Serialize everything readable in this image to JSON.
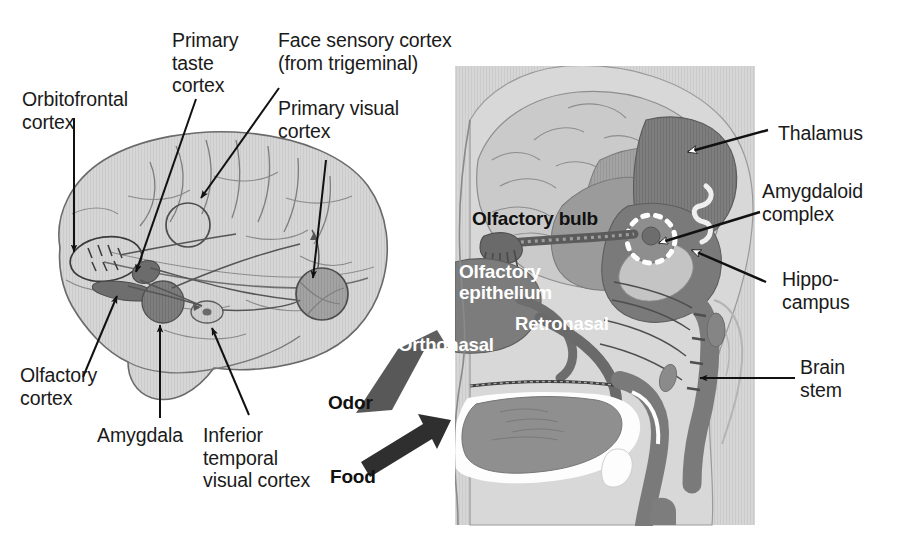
{
  "figure": {
    "type": "anatomical-diagram",
    "panels": [
      {
        "id": "left-lateral-brain",
        "description": "Lateral view of the human brain with labelled cortical areas and connecting pathways"
      },
      {
        "id": "right-midsagittal-head",
        "description": "Mid-sagittal section of the head showing nasal cavity, olfactory bulb and limbic structures"
      }
    ]
  },
  "left_panel": {
    "labels": [
      {
        "id": "orbitofrontal-cortex",
        "text": "Orbitofrontal\ncortex"
      },
      {
        "id": "primary-taste-cortex",
        "text": "Primary\ntaste\ncortex"
      },
      {
        "id": "face-sensory-cortex",
        "text": "Face sensory cortex\n(from trigeminal)"
      },
      {
        "id": "primary-visual-cortex",
        "text": "Primary visual\ncortex"
      },
      {
        "id": "olfactory-cortex",
        "text": "Olfactory\ncortex"
      },
      {
        "id": "amygdala",
        "text": "Amygdala"
      },
      {
        "id": "inferior-temporal-visual-cortex",
        "text": "Inferior\ntemporal\nvisual cortex"
      }
    ]
  },
  "right_panel": {
    "labels_outside": [
      {
        "id": "thalamus",
        "text": "Thalamus"
      },
      {
        "id": "amygdaloid-complex",
        "text": "Amygdaloid\ncomplex"
      },
      {
        "id": "hippocampus",
        "text": "Hippo-\ncampus"
      },
      {
        "id": "brain-stem",
        "text": "Brain\nstem"
      }
    ],
    "labels_inside": [
      {
        "id": "olfactory-bulb",
        "text": "Olfactory bulb",
        "color": "dark"
      },
      {
        "id": "olfactory-epithelium",
        "text": "Olfactory\nepithelium",
        "color": "light"
      },
      {
        "id": "retronasal",
        "text": "Retronasal",
        "color": "light"
      },
      {
        "id": "orthonasal",
        "text": "Orthonasal",
        "color": "light"
      }
    ],
    "input_arrows": [
      {
        "id": "odor",
        "text": "Odor",
        "color": "dark"
      },
      {
        "id": "food",
        "text": "Food",
        "color": "dark"
      }
    ]
  },
  "palette": {
    "page_background": "#ffffff",
    "text": "#1a1a1a",
    "white_text": "#ffffff",
    "panel_background": "#d3d3d3",
    "brain_fill": "#d0d0d0",
    "brain_outline": "#666666",
    "mid_gray": "#9b9b9b",
    "dark_gray": "#6f6f6f",
    "darkest_gray": "#4f4f4f",
    "highlight_white": "#fdfdfd"
  }
}
